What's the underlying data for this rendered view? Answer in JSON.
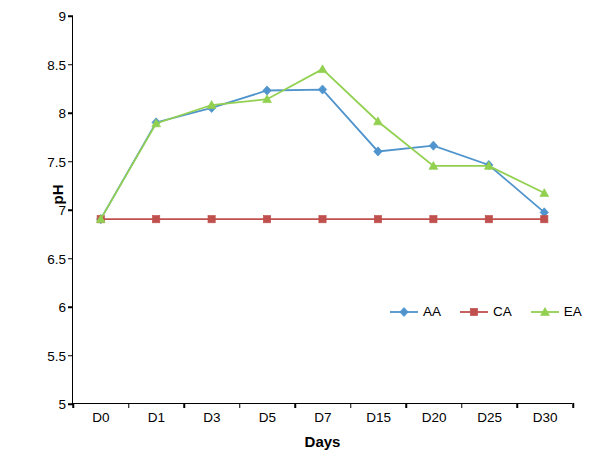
{
  "chart_data": {
    "type": "line",
    "title": "",
    "xlabel": "Days",
    "ylabel": "pH",
    "categories": [
      "D0",
      "D1",
      "D3",
      "D5",
      "D7",
      "D15",
      "D20",
      "D25",
      "D30"
    ],
    "ylim": [
      5,
      9
    ],
    "yticks": [
      5,
      5.5,
      6,
      6.5,
      7,
      7.5,
      8,
      8.5,
      9
    ],
    "ytick_labels": [
      "5",
      "5.5",
      "6",
      "6.5",
      "7",
      "7.5",
      "8",
      "8.5",
      "9"
    ],
    "grid": false,
    "legend_position": "inside-lower-right",
    "series": [
      {
        "name": "AA",
        "color": "#4f94cd",
        "marker": "diamond",
        "values": [
          6.9,
          7.9,
          8.05,
          8.23,
          8.24,
          7.6,
          7.66,
          7.46,
          6.97
        ]
      },
      {
        "name": "CA",
        "color": "#c0504d",
        "marker": "square",
        "values": [
          6.9,
          6.9,
          6.9,
          6.9,
          6.9,
          6.9,
          6.9,
          6.9,
          6.9
        ]
      },
      {
        "name": "EA",
        "color": "#92d050",
        "marker": "triangle",
        "values": [
          6.9,
          7.89,
          8.08,
          8.14,
          8.45,
          7.91,
          7.45,
          7.45,
          7.17
        ]
      }
    ]
  },
  "axis": {
    "y_title": "pH",
    "x_title": "Days"
  },
  "legend": {
    "items": [
      {
        "label": "AA"
      },
      {
        "label": "CA"
      },
      {
        "label": "EA"
      }
    ]
  }
}
